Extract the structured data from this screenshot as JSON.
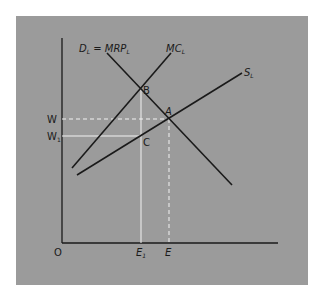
{
  "diagram": {
    "type": "labor-market-monopsony",
    "colors": {
      "background": "#ffffff",
      "panel": "#9b9b9b",
      "curve": "#1a1a1a",
      "guide": "#f2f2f2",
      "text": "#1a1a1a"
    },
    "axes": {
      "origin_label": "O",
      "x_ticks": [
        {
          "main": "E",
          "sub": "1"
        },
        {
          "main": "E",
          "sub": ""
        }
      ],
      "y_ticks": [
        {
          "main": "W",
          "sub": ""
        },
        {
          "main": "W",
          "sub": "1"
        }
      ]
    },
    "curves": {
      "demand": {
        "main": "D",
        "sub": "L",
        "eq": " = ",
        "rhs_main": "MRP",
        "rhs_sub": "L"
      },
      "marginal_cost": {
        "main": "MC",
        "sub": "L"
      },
      "supply": {
        "main": "S",
        "sub": "L"
      }
    },
    "points": {
      "B": "B",
      "A": "A",
      "C": "C"
    }
  }
}
